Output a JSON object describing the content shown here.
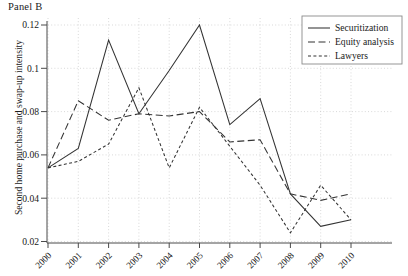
{
  "panel": {
    "title": "Panel B"
  },
  "axes": {
    "ylabel": "Second home purchase and  swap-up intensity",
    "xlabel": "",
    "yticks": [
      "0.02",
      "0.04",
      "0.06",
      "0.08",
      "0.1",
      "0.12"
    ],
    "xticks": [
      "2000",
      "2001",
      "2002",
      "2003",
      "2004",
      "2005",
      "2006",
      "2007",
      "2008",
      "2009",
      "2010"
    ]
  },
  "legend": {
    "position": "top-right",
    "items": [
      {
        "label": "Securitization",
        "style": "solid"
      },
      {
        "label": "Equity analysis",
        "style": "long-dash"
      },
      {
        "label": "Lawyers",
        "style": "short-dash"
      }
    ]
  },
  "chart_data": {
    "type": "line",
    "title": "Panel B",
    "xlabel": "",
    "ylabel": "Second home purchase and  swap-up intensity",
    "x": [
      2000,
      2001,
      2002,
      2003,
      2004,
      2005,
      2006,
      2007,
      2008,
      2009,
      2010
    ],
    "categories": [
      "2000",
      "2001",
      "2002",
      "2003",
      "2004",
      "2005",
      "2006",
      "2007",
      "2008",
      "2009",
      "2010"
    ],
    "ylim": [
      0.02,
      0.125
    ],
    "xlim": [
      2000,
      2010
    ],
    "grid": true,
    "legend_position": "top-right",
    "series": [
      {
        "name": "Securitization",
        "style": "solid",
        "values": [
          0.054,
          0.063,
          0.113,
          0.079,
          0.099,
          0.12,
          0.074,
          0.086,
          0.042,
          0.027,
          0.03
        ]
      },
      {
        "name": "Equity analysis",
        "style": "long-dash",
        "values": [
          0.054,
          0.085,
          0.076,
          0.079,
          0.078,
          0.08,
          0.066,
          0.067,
          0.042,
          0.039,
          0.042
        ]
      },
      {
        "name": "Lawyers",
        "style": "short-dash",
        "values": [
          0.054,
          0.057,
          0.065,
          0.091,
          0.054,
          0.082,
          0.064,
          0.046,
          0.024,
          0.046,
          0.03
        ]
      }
    ]
  },
  "colors": {
    "series": "#333333",
    "grid": "#c9c9c9",
    "axis": "#4a4a4a",
    "text": "#1a1a1a",
    "background": "#ffffff"
  }
}
